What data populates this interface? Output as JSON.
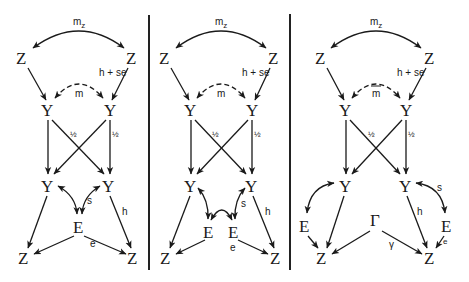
{
  "figure": {
    "type": "path-diagram",
    "panels": [
      {
        "id": "panel-1",
        "nodes": {
          "z_top_left": "Z",
          "z_top_right": "Z",
          "y1_left": "Y",
          "y1_right": "Y",
          "y2_left": "Y",
          "y2_right": "Y",
          "e_shared": "E",
          "z_bottom_left": "Z",
          "z_bottom_right": "Z"
        },
        "labels": {
          "mz": "m",
          "mz_sub": "z",
          "h_se": "h + se",
          "m": "m",
          "half_left": "½",
          "half_right": "½",
          "s": "s",
          "h": "h",
          "e": "e"
        }
      },
      {
        "id": "panel-2",
        "nodes": {
          "z_top_left": "Z",
          "z_top_right": "Z",
          "y1_left": "Y",
          "y1_right": "Y",
          "y2_left": "Y",
          "y2_right": "Y",
          "e_left": "E",
          "e_right": "E",
          "z_bottom_left": "Z",
          "z_bottom_right": "Z"
        },
        "labels": {
          "mz": "m",
          "mz_sub": "z",
          "h_se": "h + se",
          "m": "m",
          "half_left": "½",
          "half_right": "½",
          "s": "s",
          "h": "h",
          "e": "e"
        }
      },
      {
        "id": "panel-3",
        "nodes": {
          "z_top_left": "Z",
          "z_top_right": "Z",
          "y1_left": "Y",
          "y1_right": "Y",
          "y2_left": "Y",
          "y2_right": "Y",
          "e_left": "E",
          "e_right": "E",
          "gamma_node": "Γ",
          "z_bottom_left": "Z",
          "z_bottom_right": "Z"
        },
        "labels": {
          "mz": "m",
          "mz_sub": "z",
          "h_se": "h + se",
          "m": "m",
          "half_left": "½",
          "half_right": "½",
          "s": "s",
          "h": "h",
          "e": "e",
          "gamma": "γ"
        }
      }
    ]
  }
}
